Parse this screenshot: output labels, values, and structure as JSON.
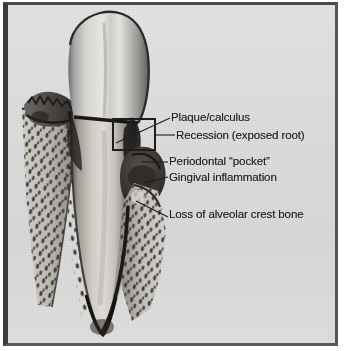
{
  "figure": {
    "kind": "anatomical-illustration",
    "background_color": "#dcdcdc",
    "ink_color": "#1d1d1d",
    "frame_color": "#3a3a3a"
  },
  "labels": [
    {
      "id": "plaque",
      "text": "Plaque/calculus"
    },
    {
      "id": "recession",
      "text": "Recession (exposed root)"
    },
    {
      "id": "pocket",
      "text": "Periodontal “pocket”"
    },
    {
      "id": "gingival",
      "text": "Gingival inflammation"
    },
    {
      "id": "bone_loss",
      "text": "Loss of alveolar crest bone"
    }
  ],
  "structures": [
    {
      "id": "crown",
      "name": "tooth-crown"
    },
    {
      "id": "root",
      "name": "tooth-root"
    },
    {
      "id": "alveolar-bone-l",
      "name": "alveolar-bone-left"
    },
    {
      "id": "alveolar-bone-r",
      "name": "alveolar-bone-right"
    },
    {
      "id": "gingiva-left",
      "name": "gingiva-left"
    },
    {
      "id": "inflamed-gingiva",
      "name": "inflamed-gingiva-right"
    },
    {
      "id": "callout-box",
      "name": "plaque-calculus-callout-box"
    }
  ]
}
